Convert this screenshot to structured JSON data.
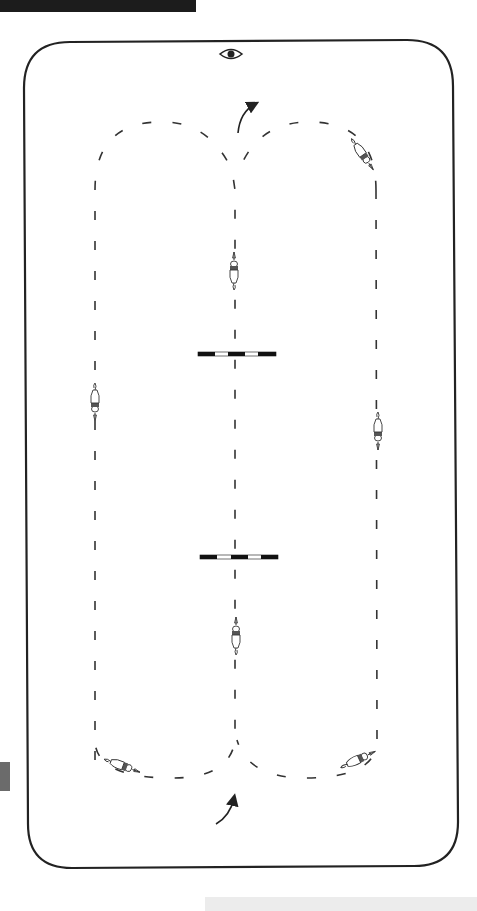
{
  "header": {
    "banner_text": ""
  },
  "arena": {
    "shape": "rounded-rectangle",
    "border_color": "#222222",
    "viewpoint_icon": "eye-icon"
  },
  "course": {
    "description": "Double-loop figure with a center line crossing two ground poles",
    "path_style": "dashed",
    "path_color": "#333333",
    "loops": [
      {
        "name": "left-loop",
        "x_line": 95
      },
      {
        "name": "right-loop",
        "x_line": 376
      }
    ],
    "center_line_x": 235,
    "poles": [
      {
        "name": "upper-pole",
        "y": 354,
        "pattern": [
          "black",
          "white",
          "black",
          "white",
          "black"
        ]
      },
      {
        "name": "lower-pole",
        "y": 557,
        "pattern": [
          "black",
          "white",
          "black",
          "white",
          "black"
        ]
      }
    ],
    "arrows": [
      {
        "name": "exit-arrow-top",
        "direction": "up-right"
      },
      {
        "name": "entry-arrow-bottom",
        "direction": "up-right"
      }
    ],
    "riders": [
      {
        "name": "rider-center-upper",
        "facing": "up"
      },
      {
        "name": "rider-center-lower",
        "facing": "up"
      },
      {
        "name": "rider-left",
        "facing": "down"
      },
      {
        "name": "rider-right",
        "facing": "down"
      },
      {
        "name": "rider-top-right",
        "facing": "down-right"
      },
      {
        "name": "rider-bottom-left",
        "facing": "right"
      },
      {
        "name": "rider-bottom-right",
        "facing": "up-right"
      }
    ]
  },
  "colors": {
    "ink": "#222222",
    "banner": "#1c1c1c",
    "tab": "#6b6b6b",
    "background": "#ffffff"
  }
}
